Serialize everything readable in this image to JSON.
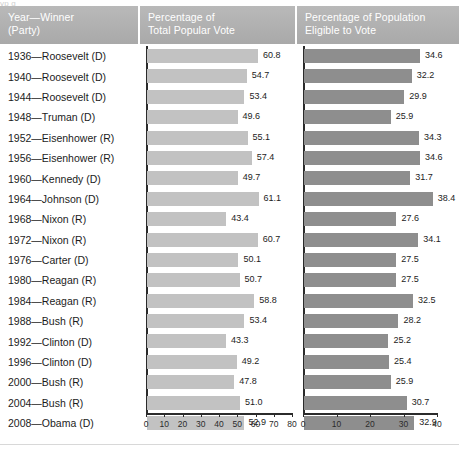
{
  "top_sliver_text": "yp   g",
  "headers": {
    "col1_line1": "Year—Winner",
    "col1_line2": "(Party)",
    "col2_line1": "Percentage of",
    "col2_line2": "Total Popular Vote",
    "col3_line1": "Percentage of Population",
    "col3_line2": "Eligible to Vote"
  },
  "colors": {
    "header_band": "#b2b2b2",
    "header_text": "#ffffff",
    "bar_popular_vote": "#c2c2c2",
    "bar_eligible": "#8e8e8e",
    "axis": "#2b2b2b",
    "page_background": "#ffffff"
  },
  "chart_data": {
    "type": "bar",
    "title": "",
    "orientation": "horizontal",
    "categories": [
      "1936—Roosevelt (D)",
      "1940—Roosevelt (D)",
      "1944—Roosevelt (D)",
      "1948—Truman (D)",
      "1952—Eisenhower (R)",
      "1956—Eisenhower (R)",
      "1960—Kennedy (D)",
      "1964—Johnson (D)",
      "1968—Nixon (R)",
      "1972—Nixon (R)",
      "1976—Carter (D)",
      "1980—Reagan (R)",
      "1984—Reagan (R)",
      "1988—Bush (R)",
      "1992—Clinton (D)",
      "1996—Clinton (D)",
      "2000—Bush (R)",
      "2004—Bush (R)",
      "2008—Obama (D)"
    ],
    "series": [
      {
        "name": "Percentage of Total Popular Vote",
        "values": [
          60.8,
          54.7,
          53.4,
          49.6,
          55.1,
          57.4,
          49.7,
          61.1,
          43.4,
          60.7,
          50.1,
          50.7,
          58.8,
          53.4,
          43.3,
          49.2,
          47.8,
          51.0,
          52.9
        ],
        "labels": [
          "60.8",
          "54.7",
          "53.4",
          "49.6",
          "55.1",
          "57.4",
          "49.7",
          "61.1",
          "43.4",
          "60.7",
          "50.1",
          "50.7",
          "58.8",
          "53.4",
          "43.3",
          "49.2",
          "47.8",
          "51.0",
          "52.9"
        ],
        "xlim": [
          0,
          80
        ],
        "xticks": [
          0,
          10,
          20,
          30,
          40,
          50,
          60,
          70,
          80
        ],
        "xticklabels": [
          "0",
          "10",
          "20",
          "30",
          "40",
          "50",
          "60",
          "70",
          "80"
        ],
        "color": "#c2c2c2"
      },
      {
        "name": "Percentage of Population Eligible to Vote",
        "values": [
          34.6,
          32.2,
          29.9,
          25.9,
          34.3,
          34.6,
          31.7,
          38.4,
          27.6,
          34.1,
          27.5,
          27.5,
          32.5,
          28.2,
          25.2,
          25.4,
          25.9,
          30.7,
          32.9
        ],
        "labels": [
          "34.6",
          "32.2",
          "29.9",
          "25.9",
          "34.3",
          "34.6",
          "31.7",
          "38.4",
          "27.6",
          "34.1",
          "27.5",
          "27.5",
          "32.5",
          "28.2",
          "25.2",
          "25.4",
          "25.9",
          "30.7",
          "32.9"
        ],
        "xlim": [
          0,
          40
        ],
        "xticks": [
          0,
          10,
          20,
          30,
          40
        ],
        "xticklabels": [
          "0",
          "10",
          "20",
          "30",
          "40"
        ],
        "color": "#8e8e8e"
      }
    ],
    "grid": false,
    "legend": "none",
    "xlabel": "",
    "ylabel": ""
  }
}
